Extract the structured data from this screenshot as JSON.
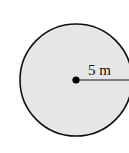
{
  "diagram": {
    "shape": "circle",
    "radius_label": "5 m",
    "fill_color": "#e6e6e6",
    "stroke_color": "#111111"
  }
}
